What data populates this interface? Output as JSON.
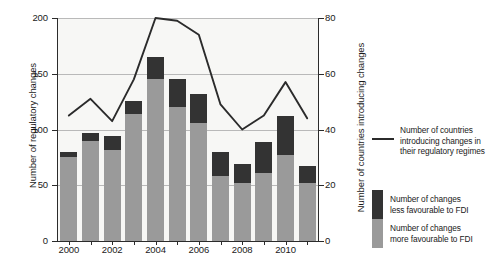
{
  "axes": {
    "left_title": "Number of regulatory changes",
    "right_title": "Number of countries introducing changes",
    "left_ticks": [
      "0",
      "50",
      "100",
      "150",
      "200"
    ],
    "right_ticks": [
      "0",
      "20",
      "40",
      "60",
      "80"
    ],
    "x_ticks": [
      "2000",
      "2002",
      "2004",
      "2006",
      "2008",
      "2010"
    ]
  },
  "legend": {
    "line_label_line1": "Number of countries",
    "line_label_line2": "introducing changes in",
    "line_label_line3": "their regulatory regimes",
    "dark_label_line1": "Number of changes",
    "dark_label_line2": "less favourable to FDI",
    "gray_label_line1": "Number of changes",
    "gray_label_line2": "more favourable to FDI",
    "line_color": "#2b2b2b",
    "dark_color": "#333333",
    "gray_color": "#9a9a9a"
  },
  "chart_data": {
    "type": "bar",
    "title": "",
    "xlabel": "",
    "ylabel": "Number of regulatory changes",
    "y2label": "Number of countries introducing changes",
    "ylim": [
      0,
      200
    ],
    "y2lim": [
      0,
      80
    ],
    "grid": true,
    "legend_position": "right",
    "categories": [
      "2000",
      "2001",
      "2002",
      "2003",
      "2004",
      "2005",
      "2006",
      "2007",
      "2008",
      "2009",
      "2010",
      "2011"
    ],
    "series": [
      {
        "name": "Number of changes more favourable to FDI",
        "type": "bar",
        "stack": "changes",
        "axis": "left",
        "color": "#9a9a9a",
        "values": [
          75,
          90,
          82,
          114,
          145,
          120,
          106,
          58,
          52,
          61,
          77,
          52
        ]
      },
      {
        "name": "Number of changes less favourable to FDI",
        "type": "bar",
        "stack": "changes",
        "axis": "left",
        "color": "#333333",
        "values": [
          5,
          7,
          12,
          12,
          20,
          25,
          26,
          22,
          17,
          28,
          35,
          15
        ]
      },
      {
        "name": "Number of countries introducing changes in their regulatory regimes",
        "type": "line",
        "axis": "right",
        "color": "#2b2b2b",
        "values": [
          45,
          51,
          43,
          58,
          80,
          79,
          74,
          49,
          40,
          45,
          57,
          44
        ]
      }
    ],
    "totals": [
      80,
      97,
      94,
      126,
      165,
      145,
      132,
      80,
      69,
      89,
      112,
      67
    ]
  }
}
